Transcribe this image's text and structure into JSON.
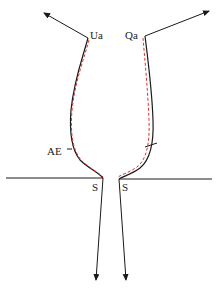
{
  "diagram": {
    "labels": {
      "ua": "Ua",
      "qa": "Qa",
      "ae": "AE",
      "s_left": "S",
      "s_right": "S"
    },
    "colors": {
      "solid_line": "#1a1a1a",
      "dashed_line": "#e03030",
      "background": "#ffffff"
    }
  }
}
